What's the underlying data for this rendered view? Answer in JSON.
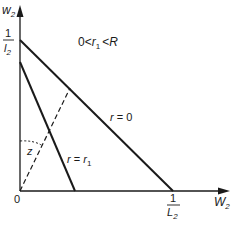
{
  "diagram": {
    "y_axis": {
      "label": "w",
      "subscript": "2"
    },
    "x_axis": {
      "label": "W",
      "subscript": "2"
    },
    "origin_label": "0",
    "y_intercept_label": {
      "numerator": "1",
      "denominator": "l",
      "subscript": "2"
    },
    "x_intercept_label": {
      "numerator": "1",
      "denominator": "L",
      "subscript": "2"
    },
    "condition_label": {
      "left": "0",
      "lt1": "<",
      "var": "r",
      "sub": "1",
      "lt2": "<",
      "right": "R"
    },
    "line_r0_label": {
      "var": "r",
      "eq": " = ",
      "value": "0"
    },
    "line_r1_label": {
      "var": "r",
      "eq": " = ",
      "value": "r",
      "sub": "1"
    },
    "angle_label": "z",
    "colors": {
      "line": "#1a1a1a",
      "background": "#ffffff"
    }
  }
}
